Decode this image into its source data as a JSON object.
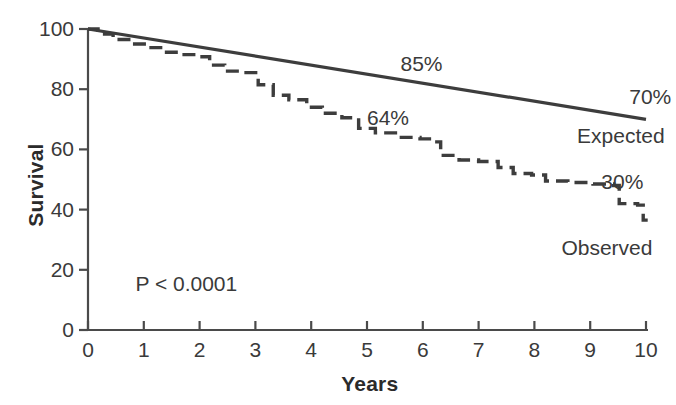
{
  "chart_data": {
    "type": "line",
    "title": "",
    "xlabel": "Years",
    "ylabel": "Survival",
    "xlim": [
      0,
      10
    ],
    "ylim": [
      0,
      100
    ],
    "grid": false,
    "legend_position": "inline-right",
    "x_ticks": [
      "0",
      "1",
      "2",
      "3",
      "4",
      "5",
      "6",
      "7",
      "8",
      "9",
      "10"
    ],
    "y_ticks": [
      "0",
      "20",
      "40",
      "60",
      "80",
      "100"
    ],
    "annotations": [
      {
        "text": "85%",
        "x": 5.6,
        "y": 88,
        "name": "expected-midpoint-label"
      },
      {
        "text": "70%",
        "x": 9.7,
        "y": 77,
        "name": "expected-endpoint-label"
      },
      {
        "text": "64%",
        "x": 5.0,
        "y": 70,
        "name": "observed-midpoint-label"
      },
      {
        "text": "30%",
        "x": 9.2,
        "y": 49,
        "name": "observed-endpoint-label"
      },
      {
        "text": "P < 0.0001",
        "x": 0.85,
        "y": 15,
        "name": "p-value-label"
      }
    ],
    "series": [
      {
        "name": "Expected",
        "style": "solid",
        "color": "#3d3d3d",
        "label_x": 9.55,
        "label_y": 64,
        "points": [
          {
            "x": 0,
            "y": 100
          },
          {
            "x": 10,
            "y": 70
          }
        ]
      },
      {
        "name": "Observed",
        "style": "dashed-step",
        "color": "#3d3d3d",
        "label_x": 9.3,
        "label_y": 27,
        "points": [
          {
            "x": 0.0,
            "y": 100.0
          },
          {
            "x": 0.18,
            "y": 98.3
          },
          {
            "x": 0.45,
            "y": 96.5
          },
          {
            "x": 0.78,
            "y": 95.0
          },
          {
            "x": 1.05,
            "y": 93.8
          },
          {
            "x": 1.35,
            "y": 92.3
          },
          {
            "x": 1.62,
            "y": 91.5
          },
          {
            "x": 1.95,
            "y": 90.8
          },
          {
            "x": 2.18,
            "y": 88.0
          },
          {
            "x": 2.45,
            "y": 86.0
          },
          {
            "x": 2.72,
            "y": 85.5
          },
          {
            "x": 3.05,
            "y": 81.5
          },
          {
            "x": 3.32,
            "y": 78.0
          },
          {
            "x": 3.6,
            "y": 76.5
          },
          {
            "x": 3.92,
            "y": 74.0
          },
          {
            "x": 4.2,
            "y": 72.0
          },
          {
            "x": 4.55,
            "y": 70.5
          },
          {
            "x": 4.85,
            "y": 67.0
          },
          {
            "x": 5.15,
            "y": 65.5
          },
          {
            "x": 5.55,
            "y": 64.0
          },
          {
            "x": 5.95,
            "y": 63.5
          },
          {
            "x": 6.18,
            "y": 62.5
          },
          {
            "x": 6.32,
            "y": 58.0
          },
          {
            "x": 6.65,
            "y": 56.5
          },
          {
            "x": 7.0,
            "y": 56.0
          },
          {
            "x": 7.35,
            "y": 54.0
          },
          {
            "x": 7.62,
            "y": 52.0
          },
          {
            "x": 7.95,
            "y": 51.5
          },
          {
            "x": 8.2,
            "y": 49.5
          },
          {
            "x": 8.6,
            "y": 49.0
          },
          {
            "x": 9.05,
            "y": 48.5
          },
          {
            "x": 9.42,
            "y": 48.0
          },
          {
            "x": 9.52,
            "y": 42.0
          },
          {
            "x": 9.85,
            "y": 41.5
          },
          {
            "x": 9.95,
            "y": 36.5
          },
          {
            "x": 10.0,
            "y": 36.0
          }
        ]
      }
    ]
  }
}
